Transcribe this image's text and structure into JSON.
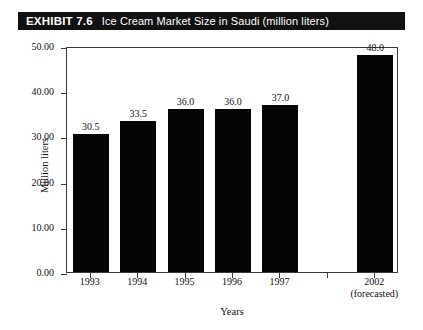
{
  "exhibit": {
    "label": "EXHIBIT 7.6",
    "title": "Ice Cream Market Size in Saudi (million liters)"
  },
  "chart_data": {
    "type": "bar",
    "title": "Ice Cream Market Size in Saudi (million liters)",
    "xlabel": "Years",
    "ylabel": "Million liters",
    "ylim": [
      0,
      50
    ],
    "ytick_labels": [
      "0.00",
      "10.00",
      "20.00",
      "30.00",
      "40.00",
      "50.00"
    ],
    "ytick_values": [
      0,
      10,
      20,
      30,
      40,
      50
    ],
    "grid": false,
    "legend": null,
    "categories": [
      "1993",
      "1994",
      "1995",
      "1996",
      "1997",
      "",
      "2002"
    ],
    "category_sublabels": [
      "",
      "",
      "",
      "",
      "",
      "",
      "(forecasted)"
    ],
    "values": [
      30.5,
      33.5,
      36.0,
      36.0,
      37.0,
      null,
      48.0
    ],
    "data_labels": [
      "30.5",
      "33.5",
      "36.0",
      "36.0",
      "37.0",
      "",
      "48.0"
    ],
    "bar_color": "#050505",
    "axis_color": "#3a3a3a",
    "background": "#ffffff"
  },
  "axis": {
    "y_title": "Million liters",
    "x_title": "Years",
    "ticks": [
      {
        "label": "0.00",
        "value": 0
      },
      {
        "label": "10.00",
        "value": 10
      },
      {
        "label": "20.00",
        "value": 20
      },
      {
        "label": "30.00",
        "value": 30
      },
      {
        "label": "40.00",
        "value": 40
      },
      {
        "label": "50.00",
        "value": 50
      }
    ]
  },
  "colors": {
    "banner_bg": "#111111",
    "banner_text": "#ffffff",
    "bar": "#050505",
    "frame": "#3a3a3a"
  }
}
